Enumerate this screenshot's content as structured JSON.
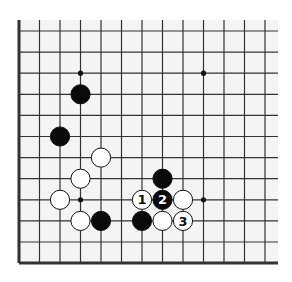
{
  "diagram": {
    "type": "go-board-fragment",
    "grid": {
      "origin_x": 19,
      "origin_y": 31,
      "spacing_x": 20.5,
      "spacing_y": 21.1,
      "columns": 13,
      "rows": 12,
      "edges": {
        "left": true,
        "bottom": true,
        "top": false,
        "right": false
      }
    },
    "star_points": [
      {
        "col": 3,
        "row": 2
      },
      {
        "col": 9,
        "row": 2
      },
      {
        "col": 3,
        "row": 8
      },
      {
        "col": 9,
        "row": 8
      }
    ],
    "stones": [
      {
        "color": "black",
        "col": 3,
        "row": 3,
        "label": ""
      },
      {
        "color": "black",
        "col": 2,
        "row": 5,
        "label": ""
      },
      {
        "color": "white",
        "col": 4,
        "row": 6,
        "label": ""
      },
      {
        "color": "white",
        "col": 3,
        "row": 7,
        "label": ""
      },
      {
        "color": "white",
        "col": 2,
        "row": 8,
        "label": ""
      },
      {
        "color": "white",
        "col": 3,
        "row": 9,
        "label": ""
      },
      {
        "color": "black",
        "col": 4,
        "row": 9,
        "label": ""
      },
      {
        "color": "black",
        "col": 7,
        "row": 7,
        "label": ""
      },
      {
        "color": "white",
        "col": 6,
        "row": 8,
        "label": "1"
      },
      {
        "color": "black",
        "col": 7,
        "row": 8,
        "label": "2"
      },
      {
        "color": "white",
        "col": 8,
        "row": 8,
        "label": ""
      },
      {
        "color": "black",
        "col": 6,
        "row": 9,
        "label": ""
      },
      {
        "color": "white",
        "col": 7,
        "row": 9,
        "label": ""
      },
      {
        "color": "white",
        "col": 8,
        "row": 9,
        "label": "3"
      }
    ],
    "colors": {
      "line": "#333333",
      "black_stone": "#0a0a0a",
      "white_stone": "#ffffff",
      "background": "#f4f4f4"
    }
  }
}
